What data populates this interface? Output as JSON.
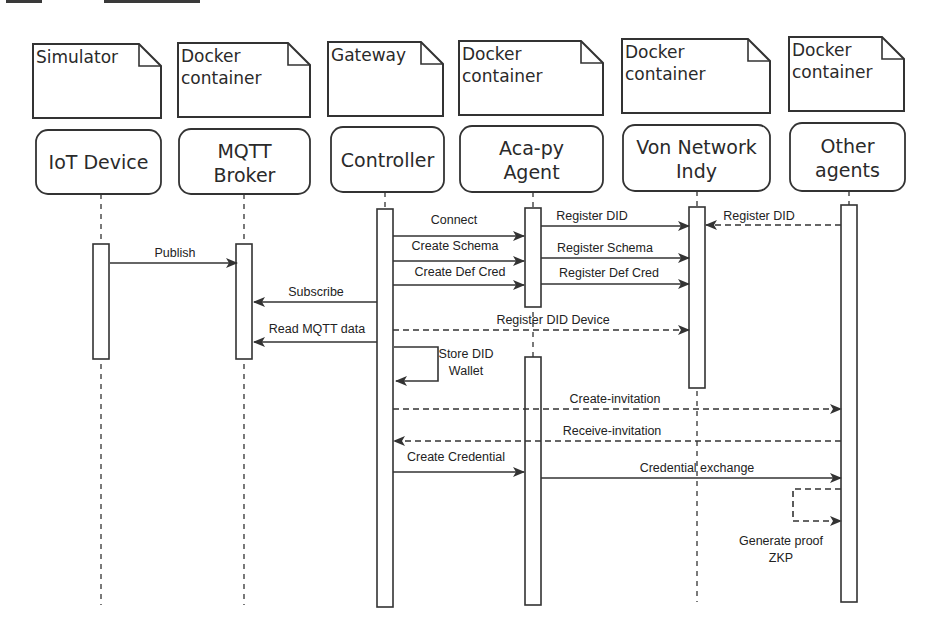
{
  "diagram": {
    "type": "uml-sequence-diagram",
    "colors": {
      "stroke": "#333333",
      "text": "#2a2a2a",
      "background": "#ffffff",
      "fill": "#ffffff"
    },
    "participants": [
      {
        "id": "iot",
        "container": [
          "Simulator"
        ],
        "name": [
          "IoT Device"
        ],
        "x": 101,
        "note": {
          "x": 33,
          "y": 44,
          "w": 128,
          "h": 74,
          "fold": 22
        },
        "box": {
          "x": 36,
          "y": 130,
          "w": 125,
          "h": 64
        },
        "lifeline_end": 605,
        "activations": [
          {
            "y1": 244,
            "y2": 359
          }
        ]
      },
      {
        "id": "mqtt",
        "container": [
          "Docker",
          "container"
        ],
        "name": [
          "MQTT",
          "Broker"
        ],
        "x": 244,
        "note": {
          "x": 178,
          "y": 43,
          "w": 132,
          "h": 74,
          "fold": 22
        },
        "box": {
          "x": 179,
          "y": 129,
          "w": 131,
          "h": 65
        },
        "lifeline_end": 605,
        "activations": [
          {
            "y1": 244,
            "y2": 359
          }
        ]
      },
      {
        "id": "ctrl",
        "container": [
          "Gateway"
        ],
        "name": [
          "Controller"
        ],
        "x": 385,
        "note": {
          "x": 328,
          "y": 42,
          "w": 115,
          "h": 74,
          "fold": 22
        },
        "box": {
          "x": 331,
          "y": 127,
          "w": 113,
          "h": 65
        },
        "lifeline_end": 607,
        "activations": [
          {
            "y1": 209,
            "y2": 607
          }
        ]
      },
      {
        "id": "acapy",
        "container": [
          "Docker",
          "container"
        ],
        "name": [
          "Aca-py",
          "Agent"
        ],
        "x": 533,
        "note": {
          "x": 459,
          "y": 41,
          "w": 144,
          "h": 74,
          "fold": 22
        },
        "box": {
          "x": 460,
          "y": 126,
          "w": 143,
          "h": 66
        },
        "lifeline_end": 605,
        "activations": [
          {
            "y1": 208,
            "y2": 307
          },
          {
            "y1": 357,
            "y2": 605
          }
        ]
      },
      {
        "id": "von",
        "container": [
          "Docker",
          "container"
        ],
        "name": [
          "Von Network",
          "Indy"
        ],
        "x": 697,
        "note": {
          "x": 622,
          "y": 39,
          "w": 148,
          "h": 74,
          "fold": 22
        },
        "box": {
          "x": 623,
          "y": 125,
          "w": 147,
          "h": 66
        },
        "lifeline_end": 602,
        "activations": [
          {
            "y1": 207,
            "y2": 388
          }
        ]
      },
      {
        "id": "other",
        "container": [
          "Docker",
          "container"
        ],
        "name": [
          "Other",
          "agents"
        ],
        "x": 849,
        "note": {
          "x": 789,
          "y": 37,
          "w": 115,
          "h": 74,
          "fold": 22
        },
        "box": {
          "x": 790,
          "y": 123,
          "w": 115,
          "h": 68
        },
        "lifeline_end": 602,
        "activations": [
          {
            "y1": 205,
            "y2": 602
          }
        ]
      }
    ],
    "messages": [
      {
        "label": "Connect",
        "x1": 393,
        "x2": 524,
        "y": 236,
        "style": "solid",
        "lx": 454,
        "ly": 224
      },
      {
        "label": "Register DID",
        "x1": 541,
        "x2": 689,
        "y": 226,
        "style": "solid",
        "lx": 592,
        "ly": 220
      },
      {
        "label": "Register DID",
        "x1": 841,
        "x2": 706,
        "y": 225,
        "style": "dashed",
        "lx": 759,
        "ly": 220
      },
      {
        "label": "Create Schema",
        "x1": 393,
        "x2": 524,
        "y": 261,
        "style": "solid",
        "lx": 455,
        "ly": 250
      },
      {
        "label": "Register Schema",
        "x1": 541,
        "x2": 689,
        "y": 258,
        "style": "solid",
        "lx": 605,
        "ly": 252
      },
      {
        "label": "Publish",
        "x1": 110,
        "x2": 237,
        "y": 263,
        "style": "solid",
        "lx": 175,
        "ly": 257
      },
      {
        "label": "Create Def Cred",
        "x1": 393,
        "x2": 524,
        "y": 285,
        "style": "solid",
        "lx": 460,
        "ly": 276
      },
      {
        "label": "Register Def Cred",
        "x1": 541,
        "x2": 689,
        "y": 284,
        "style": "solid",
        "lx": 609,
        "ly": 277
      },
      {
        "label": "Subscribe",
        "x1": 377,
        "x2": 254,
        "y": 302,
        "style": "solid",
        "lx": 316,
        "ly": 296
      },
      {
        "label": "Read MQTT data",
        "x1": 377,
        "x2": 254,
        "y": 342,
        "style": "solid",
        "lx": 317,
        "ly": 333
      },
      {
        "label": "Register DID Device",
        "x1": 393,
        "x2": 689,
        "y": 330,
        "style": "dashed",
        "lx": 553,
        "ly": 324
      },
      {
        "label": "Create-invitation",
        "x1": 393,
        "x2": 841,
        "y": 409,
        "style": "dashed",
        "lx": 615,
        "ly": 403
      },
      {
        "label": "Receive-invitation",
        "x1": 841,
        "x2": 394,
        "y": 441,
        "style": "dashed",
        "lx": 612,
        "ly": 435
      },
      {
        "label": "Create Credential",
        "x1": 393,
        "x2": 524,
        "y": 472,
        "style": "solid",
        "lx": 456,
        "ly": 461
      },
      {
        "label": "Credential exchange",
        "x1": 541,
        "x2": 841,
        "y": 478,
        "style": "solid",
        "lx": 697,
        "ly": 472
      }
    ],
    "self_loops": [
      {
        "label": [
          "Store DID",
          "Wallet"
        ],
        "x": 394,
        "y1": 347,
        "y2": 381,
        "w": 44,
        "style": "solid",
        "lx": 466,
        "ly": 358,
        "dir": "right"
      },
      {
        "label": [
          "Generate proof",
          "ZKP"
        ],
        "x": 841,
        "y1": 489,
        "y2": 521,
        "w": 48,
        "style": "dashed",
        "lx": 781,
        "ly": 545,
        "dir": "left"
      }
    ]
  }
}
